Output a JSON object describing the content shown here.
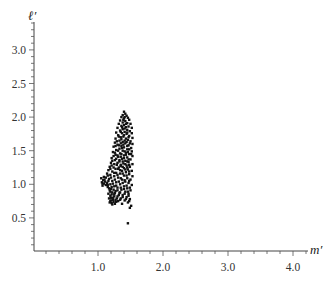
{
  "chart_data": {
    "type": "scatter",
    "title": "",
    "xlabel": "m′",
    "ylabel": "ℓ′",
    "xlim": [
      0,
      4.2
    ],
    "ylim": [
      0,
      3.4
    ],
    "x_ticks": [
      1.0,
      2.0,
      3.0,
      4.0
    ],
    "x_tick_labels": [
      "1.0",
      "2.0",
      "3.0",
      "4.0"
    ],
    "y_ticks": [
      0.5,
      1.0,
      1.5,
      2.0,
      2.5,
      3.0
    ],
    "y_tick_labels": [
      "0.5",
      "1.0",
      "1.5",
      "2.0",
      "2.5",
      "3.0"
    ],
    "grid": false,
    "legend": null,
    "marker_color": "#111111",
    "series": [
      {
        "name": "points",
        "points": [
          [
            1.4,
            2.08
          ],
          [
            1.42,
            2.05
          ],
          [
            1.38,
            2.03
          ],
          [
            1.44,
            2.02
          ],
          [
            1.36,
            2.0
          ],
          [
            1.46,
            1.99
          ],
          [
            1.4,
            1.98
          ],
          [
            1.48,
            1.96
          ],
          [
            1.34,
            1.95
          ],
          [
            1.42,
            1.94
          ],
          [
            1.38,
            1.92
          ],
          [
            1.45,
            1.91
          ],
          [
            1.32,
            1.9
          ],
          [
            1.5,
            1.9
          ],
          [
            1.4,
            1.88
          ],
          [
            1.36,
            1.87
          ],
          [
            1.47,
            1.86
          ],
          [
            1.43,
            1.85
          ],
          [
            1.3,
            1.84
          ],
          [
            1.52,
            1.84
          ],
          [
            1.38,
            1.82
          ],
          [
            1.45,
            1.81
          ],
          [
            1.34,
            1.8
          ],
          [
            1.49,
            1.79
          ],
          [
            1.41,
            1.78
          ],
          [
            1.28,
            1.77
          ],
          [
            1.37,
            1.76
          ],
          [
            1.52,
            1.76
          ],
          [
            1.44,
            1.75
          ],
          [
            1.31,
            1.73
          ],
          [
            1.48,
            1.72
          ],
          [
            1.39,
            1.71
          ],
          [
            1.35,
            1.7
          ],
          [
            1.53,
            1.69
          ],
          [
            1.27,
            1.68
          ],
          [
            1.43,
            1.68
          ],
          [
            1.46,
            1.66
          ],
          [
            1.33,
            1.65
          ],
          [
            1.5,
            1.64
          ],
          [
            1.38,
            1.63
          ],
          [
            1.26,
            1.62
          ],
          [
            1.42,
            1.61
          ],
          [
            1.53,
            1.6
          ],
          [
            1.3,
            1.59
          ],
          [
            1.47,
            1.58
          ],
          [
            1.36,
            1.57
          ],
          [
            1.24,
            1.56
          ],
          [
            1.4,
            1.55
          ],
          [
            1.51,
            1.54
          ],
          [
            1.33,
            1.53
          ],
          [
            1.45,
            1.52
          ],
          [
            1.28,
            1.51
          ],
          [
            1.38,
            1.5
          ],
          [
            1.52,
            1.49
          ],
          [
            1.23,
            1.48
          ],
          [
            1.43,
            1.47
          ],
          [
            1.34,
            1.46
          ],
          [
            1.48,
            1.45
          ],
          [
            1.27,
            1.44
          ],
          [
            1.4,
            1.43
          ],
          [
            1.53,
            1.42
          ],
          [
            1.31,
            1.41
          ],
          [
            1.45,
            1.4
          ],
          [
            1.21,
            1.39
          ],
          [
            1.37,
            1.38
          ],
          [
            1.5,
            1.37
          ],
          [
            1.26,
            1.36
          ],
          [
            1.42,
            1.35
          ],
          [
            1.33,
            1.34
          ],
          [
            1.47,
            1.33
          ],
          [
            1.2,
            1.32
          ],
          [
            1.39,
            1.31
          ],
          [
            1.53,
            1.3
          ],
          [
            1.29,
            1.29
          ],
          [
            1.44,
            1.28
          ],
          [
            1.35,
            1.27
          ],
          [
            1.18,
            1.26
          ],
          [
            1.49,
            1.26
          ],
          [
            1.24,
            1.25
          ],
          [
            1.4,
            1.24
          ],
          [
            1.31,
            1.23
          ],
          [
            1.46,
            1.22
          ],
          [
            1.16,
            1.21
          ],
          [
            1.37,
            1.2
          ],
          [
            1.52,
            1.2
          ],
          [
            1.22,
            1.19
          ],
          [
            1.43,
            1.18
          ],
          [
            1.28,
            1.17
          ],
          [
            1.14,
            1.16
          ],
          [
            1.34,
            1.16
          ],
          [
            1.48,
            1.15
          ],
          [
            1.19,
            1.14
          ],
          [
            1.4,
            1.13
          ],
          [
            1.25,
            1.12
          ],
          [
            1.53,
            1.12
          ],
          [
            1.09,
            1.11
          ],
          [
            1.12,
            1.1
          ],
          [
            1.31,
            1.1
          ],
          [
            1.45,
            1.09
          ],
          [
            1.05,
            1.09
          ],
          [
            1.17,
            1.08
          ],
          [
            1.37,
            1.07
          ],
          [
            1.5,
            1.07
          ],
          [
            1.08,
            1.06
          ],
          [
            1.22,
            1.05
          ],
          [
            1.11,
            1.04
          ],
          [
            1.42,
            1.04
          ],
          [
            1.28,
            1.03
          ],
          [
            1.06,
            1.03
          ],
          [
            1.14,
            1.02
          ],
          [
            1.47,
            1.02
          ],
          [
            1.09,
            1.01
          ],
          [
            1.19,
            1.0
          ],
          [
            1.34,
            1.0
          ],
          [
            1.12,
            0.99
          ],
          [
            1.52,
            0.99
          ],
          [
            1.07,
            0.98
          ],
          [
            1.25,
            0.97
          ],
          [
            1.4,
            0.97
          ],
          [
            1.15,
            0.96
          ],
          [
            1.3,
            0.95
          ],
          [
            1.45,
            0.94
          ],
          [
            1.2,
            0.93
          ],
          [
            1.36,
            0.92
          ],
          [
            1.18,
            0.91
          ],
          [
            1.5,
            0.91
          ],
          [
            1.27,
            0.9
          ],
          [
            1.42,
            0.89
          ],
          [
            1.22,
            0.88
          ],
          [
            1.33,
            0.87
          ],
          [
            1.16,
            0.86
          ],
          [
            1.47,
            0.86
          ],
          [
            1.25,
            0.85
          ],
          [
            1.38,
            0.84
          ],
          [
            1.19,
            0.83
          ],
          [
            1.3,
            0.82
          ],
          [
            1.44,
            0.81
          ],
          [
            1.23,
            0.8
          ],
          [
            1.17,
            0.79
          ],
          [
            1.35,
            0.79
          ],
          [
            1.49,
            0.78
          ],
          [
            1.27,
            0.77
          ],
          [
            1.2,
            0.76
          ],
          [
            1.41,
            0.76
          ],
          [
            1.31,
            0.75
          ],
          [
            1.24,
            0.74
          ],
          [
            1.18,
            0.73
          ],
          [
            1.46,
            0.73
          ],
          [
            1.21,
            0.72
          ],
          [
            1.37,
            0.71
          ],
          [
            1.26,
            0.71
          ],
          [
            1.51,
            0.68
          ],
          [
            1.49,
            0.65
          ],
          [
            1.46,
            0.42
          ],
          [
            1.41,
            2.0
          ],
          [
            1.39,
            1.96
          ],
          [
            1.43,
            1.9
          ],
          [
            1.37,
            1.85
          ],
          [
            1.41,
            1.83
          ],
          [
            1.35,
            1.78
          ],
          [
            1.45,
            1.77
          ],
          [
            1.4,
            1.73
          ],
          [
            1.32,
            1.71
          ],
          [
            1.47,
            1.7
          ],
          [
            1.36,
            1.67
          ],
          [
            1.41,
            1.65
          ],
          [
            1.29,
            1.64
          ],
          [
            1.44,
            1.63
          ],
          [
            1.35,
            1.61
          ],
          [
            1.49,
            1.61
          ],
          [
            1.39,
            1.59
          ],
          [
            1.32,
            1.58
          ],
          [
            1.45,
            1.57
          ],
          [
            1.27,
            1.57
          ],
          [
            1.37,
            1.54
          ],
          [
            1.48,
            1.52
          ],
          [
            1.31,
            1.5
          ],
          [
            1.41,
            1.49
          ],
          [
            1.26,
            1.47
          ],
          [
            1.46,
            1.48
          ],
          [
            1.36,
            1.45
          ],
          [
            1.3,
            1.43
          ],
          [
            1.43,
            1.44
          ],
          [
            1.51,
            1.45
          ],
          [
            1.24,
            1.42
          ],
          [
            1.35,
            1.41
          ],
          [
            1.4,
            1.39
          ],
          [
            1.28,
            1.38
          ],
          [
            1.47,
            1.37
          ],
          [
            1.33,
            1.36
          ],
          [
            1.22,
            1.35
          ],
          [
            1.45,
            1.34
          ],
          [
            1.38,
            1.34
          ],
          [
            1.3,
            1.32
          ],
          [
            1.42,
            1.3
          ],
          [
            1.25,
            1.3
          ],
          [
            1.35,
            1.29
          ],
          [
            1.48,
            1.29
          ],
          [
            1.21,
            1.28
          ],
          [
            1.38,
            1.26
          ],
          [
            1.32,
            1.25
          ],
          [
            1.45,
            1.25
          ],
          [
            1.27,
            1.23
          ],
          [
            1.42,
            1.22
          ],
          [
            1.19,
            1.23
          ],
          [
            1.34,
            1.21
          ],
          [
            1.48,
            1.19
          ],
          [
            1.25,
            1.17
          ],
          [
            1.38,
            1.16
          ],
          [
            1.15,
            1.13
          ],
          [
            1.3,
            1.14
          ],
          [
            1.44,
            1.13
          ],
          [
            1.2,
            1.1
          ],
          [
            1.35,
            1.09
          ],
          [
            1.1,
            1.07
          ],
          [
            1.26,
            1.07
          ],
          [
            1.41,
            1.06
          ],
          [
            1.16,
            1.05
          ],
          [
            1.32,
            1.04
          ],
          [
            1.48,
            1.05
          ],
          [
            1.07,
            1.01
          ],
          [
            1.23,
            1.01
          ],
          [
            1.38,
            1.02
          ],
          [
            1.15,
            0.99
          ],
          [
            1.28,
            0.98
          ],
          [
            1.44,
            0.98
          ],
          [
            1.21,
            0.96
          ],
          [
            1.35,
            0.95
          ],
          [
            1.17,
            0.94
          ],
          [
            1.49,
            0.95
          ],
          [
            1.24,
            0.92
          ],
          [
            1.4,
            0.93
          ],
          [
            1.3,
            0.91
          ],
          [
            1.19,
            0.89
          ],
          [
            1.46,
            0.89
          ],
          [
            1.34,
            0.88
          ],
          [
            1.26,
            0.87
          ],
          [
            1.41,
            0.86
          ],
          [
            1.21,
            0.85
          ],
          [
            1.32,
            0.84
          ],
          [
            1.47,
            0.83
          ],
          [
            1.25,
            0.82
          ],
          [
            1.38,
            0.81
          ],
          [
            1.2,
            0.8
          ],
          [
            1.29,
            0.79
          ],
          [
            1.43,
            0.78
          ],
          [
            1.23,
            0.77
          ],
          [
            1.34,
            0.77
          ],
          [
            1.19,
            0.75
          ],
          [
            1.28,
            0.74
          ],
          [
            1.22,
            0.7
          ],
          [
            1.48,
            0.75
          ]
        ]
      }
    ]
  }
}
